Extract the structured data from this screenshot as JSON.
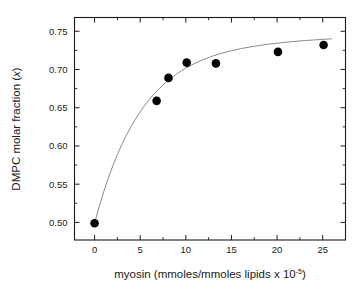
{
  "chart_data": {
    "type": "scatter",
    "title": "",
    "subtitle": "",
    "xlabel": "myosin (mmoles/mmoles lipids x 10",
    "xlabel_exponent": "-5",
    "xlabel_suffix": ")",
    "ylabel_prefix": "DMPC molar fraction (",
    "ylabel_var": "x",
    "ylabel_suffix": ")",
    "xlim": [
      -2.2,
      27.5
    ],
    "ylim": [
      0.477,
      0.768
    ],
    "xticks": [
      0,
      5,
      10,
      15,
      20,
      25
    ],
    "xtick_labels": [
      "0",
      "5",
      "10",
      "15",
      "20",
      "25"
    ],
    "yticks": [
      0.5,
      0.55,
      0.6,
      0.65,
      0.7,
      0.75
    ],
    "ytick_labels": [
      "0.50",
      "0.55",
      "0.60",
      "0.65",
      "0.70",
      "0.75"
    ],
    "grid": false,
    "legend": null,
    "frame": "box",
    "tick_direction": "in",
    "minor_ticks": true,
    "marker_color": "#000000",
    "curve_color": "#8a8a8a",
    "axis_color": "#1a1a1a",
    "background": "#ffffff",
    "x": [
      0.0,
      6.8,
      8.1,
      10.1,
      13.3,
      20.1,
      25.1
    ],
    "y": [
      0.499,
      0.659,
      0.689,
      0.709,
      0.708,
      0.723,
      0.732
    ],
    "series": [
      {
        "name": "DMPC molar fraction vs myosin",
        "marker": "filled-circle",
        "points": [
          {
            "x": 0.0,
            "y": 0.499
          },
          {
            "x": 6.8,
            "y": 0.659
          },
          {
            "x": 8.1,
            "y": 0.689
          },
          {
            "x": 10.1,
            "y": 0.709
          },
          {
            "x": 13.3,
            "y": 0.708
          },
          {
            "x": 20.1,
            "y": 0.723
          },
          {
            "x": 25.1,
            "y": 0.732
          }
        ]
      },
      {
        "name": "fit curve",
        "type": "line",
        "model": "saturation",
        "points": [
          {
            "x": 0.0,
            "y": 0.499
          },
          {
            "x": 0.5,
            "y": 0.5205
          },
          {
            "x": 1.0,
            "y": 0.54
          },
          {
            "x": 1.5,
            "y": 0.5578
          },
          {
            "x": 2.0,
            "y": 0.574
          },
          {
            "x": 2.5,
            "y": 0.5887
          },
          {
            "x": 3.0,
            "y": 0.6021
          },
          {
            "x": 3.5,
            "y": 0.6143
          },
          {
            "x": 4.0,
            "y": 0.6254
          },
          {
            "x": 4.5,
            "y": 0.6355
          },
          {
            "x": 5.0,
            "y": 0.6447
          },
          {
            "x": 5.5,
            "y": 0.6531
          },
          {
            "x": 6.0,
            "y": 0.6607
          },
          {
            "x": 6.5,
            "y": 0.6677
          },
          {
            "x": 7.0,
            "y": 0.674
          },
          {
            "x": 7.5,
            "y": 0.6798
          },
          {
            "x": 8.0,
            "y": 0.685
          },
          {
            "x": 8.5,
            "y": 0.6898
          },
          {
            "x": 9.0,
            "y": 0.6942
          },
          {
            "x": 9.5,
            "y": 0.6982
          },
          {
            "x": 10.0,
            "y": 0.7018
          },
          {
            "x": 11.0,
            "y": 0.7081
          },
          {
            "x": 12.0,
            "y": 0.7134
          },
          {
            "x": 13.0,
            "y": 0.7178
          },
          {
            "x": 14.0,
            "y": 0.7215
          },
          {
            "x": 15.0,
            "y": 0.7246
          },
          {
            "x": 16.0,
            "y": 0.7272
          },
          {
            "x": 17.0,
            "y": 0.7294
          },
          {
            "x": 18.0,
            "y": 0.7313
          },
          {
            "x": 19.0,
            "y": 0.733
          },
          {
            "x": 20.0,
            "y": 0.7344
          },
          {
            "x": 21.0,
            "y": 0.7357
          },
          {
            "x": 22.0,
            "y": 0.7368
          },
          {
            "x": 23.0,
            "y": 0.7378
          },
          {
            "x": 24.0,
            "y": 0.7386
          },
          {
            "x": 25.0,
            "y": 0.7394
          },
          {
            "x": 26.0,
            "y": 0.7401
          }
        ]
      }
    ]
  }
}
